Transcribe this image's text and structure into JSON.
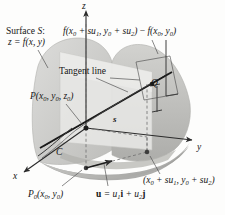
{
  "figure": {
    "type": "directional-derivative-3d-diagram",
    "colors": {
      "surface_light": "#d8d8d6",
      "surface_mid": "#c4c4c1",
      "surface_dark": "#a9a9a6",
      "plane_fill": "#e6e6e4",
      "base_fill": "#b5b5b2",
      "line": "#2b2b2b",
      "dashed": "#6e6e6e",
      "background": "#fdfdfc"
    }
  },
  "labels": {
    "surface_title": "Surface S:",
    "surface_equation": "z = f(x, y)",
    "difference_expression": "f(x0 + su1, y0 + su2) − f(x0, y0)",
    "tangent_line": "Tangent line",
    "point_P": "P(x0, y0, z0)",
    "point_Q": "Q",
    "distance_s": "s",
    "curve_C": "C",
    "point_P0": "P0(x0, y0)",
    "vector_u": "u = u1i + u2j",
    "base_point": "(x0 + su1, y0 + su2)"
  },
  "axes": {
    "x_label": "x",
    "y_label": "y",
    "z_label": "z"
  }
}
